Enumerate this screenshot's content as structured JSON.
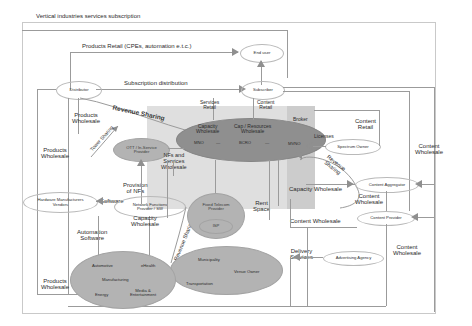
{
  "diagram": {
    "title": "Vertical industries services subscription",
    "type": "telecom ecosystem value-network diagram",
    "nodes": [
      {
        "id": "end-user",
        "label": "End user",
        "shape": "ellipse",
        "fill": "white"
      },
      {
        "id": "subscriber",
        "label": "Subscriber",
        "shape": "ellipse",
        "fill": "white"
      },
      {
        "id": "distributor",
        "label": "Distributor",
        "shape": "ellipse",
        "fill": "white"
      },
      {
        "id": "operators",
        "label": "",
        "shape": "ellipse",
        "fill": "dark-grey"
      },
      {
        "id": "mno",
        "label": "MNO",
        "shape": "text-in-ellipse"
      },
      {
        "id": "bcro",
        "label": "BCRO",
        "shape": "text-in-ellipse"
      },
      {
        "id": "mvno",
        "label": "MVNO",
        "shape": "text-in-ellipse"
      },
      {
        "id": "ott-provider",
        "label": "OTT / In-Service\nProvider",
        "shape": "ellipse",
        "fill": "light-grey"
      },
      {
        "id": "spectrum-owner",
        "label": "Spectrum Owner",
        "shape": "ellipse",
        "fill": "white"
      },
      {
        "id": "content-aggregator",
        "label": "Content Aggregator",
        "shape": "ellipse",
        "fill": "white"
      },
      {
        "id": "content-provider",
        "label": "Content Provider",
        "shape": "ellipse",
        "fill": "white"
      },
      {
        "id": "advertising-agency",
        "label": "Advertising Agency",
        "shape": "ellipse",
        "fill": "white"
      },
      {
        "id": "hardware-manufacturers",
        "label": "Hardware Manufacturers\nVendors",
        "shape": "ellipse",
        "fill": "white"
      },
      {
        "id": "nf-provider",
        "label": "Network Functions\nProvider / SW",
        "shape": "ellipse",
        "fill": "white"
      },
      {
        "id": "fixed-telecom-provider",
        "label": "Fixed Telecom\nProvider",
        "shape": "ellipse",
        "fill": "grey"
      },
      {
        "id": "isp",
        "label": "ISP",
        "shape": "ellipse",
        "fill": "grey"
      },
      {
        "id": "municipality-group",
        "label": "",
        "shape": "ellipse",
        "fill": "grey"
      },
      {
        "id": "municipality",
        "label": "Municipality",
        "shape": "text"
      },
      {
        "id": "venue-owner",
        "label": "Venue Owner",
        "shape": "text"
      },
      {
        "id": "transportation",
        "label": "Transportation",
        "shape": "text"
      },
      {
        "id": "verticals-group",
        "label": "",
        "shape": "ellipse",
        "fill": "grey"
      },
      {
        "id": "automotive",
        "label": "Automotive",
        "shape": "text"
      },
      {
        "id": "ehealth",
        "label": "eHealth",
        "shape": "text"
      },
      {
        "id": "manufacturing",
        "label": "Manufacturing",
        "shape": "text"
      },
      {
        "id": "energy",
        "label": "Energy",
        "shape": "text"
      },
      {
        "id": "media-entertainment",
        "label": "Media &\nEntertainment",
        "shape": "text"
      }
    ],
    "edge_labels": [
      {
        "id": "products-retail",
        "text": "Products Retail (CPEs, automation e.t.c.)"
      },
      {
        "id": "subscription-distribution",
        "text": "Subscription distribution"
      },
      {
        "id": "revenue-sharing-top",
        "text": "Revenue Sharing"
      },
      {
        "id": "services-retail",
        "text": "Services\nRetail"
      },
      {
        "id": "content-retail-top",
        "text": "Content\nRetail"
      },
      {
        "id": "capacity-wholesale-1",
        "text": "Capacity\nWholesale"
      },
      {
        "id": "cap-resources-wholesale",
        "text": "Cap / Resources\nWholesale"
      },
      {
        "id": "broker",
        "text": "Broker"
      },
      {
        "id": "licenses",
        "text": "Licenses"
      },
      {
        "id": "content-retail-right",
        "text": "Content\nRetail"
      },
      {
        "id": "content-wholesale-far-right",
        "text": "Content\nWholesale"
      },
      {
        "id": "revenue-sharing-right",
        "text": "Revenue\nSharing"
      },
      {
        "id": "capacity-wholesale-right",
        "text": "Capacity Wholesale"
      },
      {
        "id": "content-wholesale-mid",
        "text": "Content\nWholesale"
      },
      {
        "id": "content-wholesale-left2",
        "text": "Content Wholesale"
      },
      {
        "id": "content-wholesale-right2",
        "text": "Content\nWholesale"
      },
      {
        "id": "delivery-services",
        "text": "Delivery\nServices"
      },
      {
        "id": "products-wholesale-1",
        "text": "Products\nWholesale"
      },
      {
        "id": "products-wholesale-2",
        "text": "Products\nWholesale"
      },
      {
        "id": "products-wholesale-3",
        "text": "Products\nWholesale"
      },
      {
        "id": "tower-sharing",
        "text": "Tower Sharing"
      },
      {
        "id": "nfs-services-wholesale",
        "text": "NFs and\nServices\nWholesale"
      },
      {
        "id": "provision-of-nfs",
        "text": "Provision\nof NFs"
      },
      {
        "id": "software",
        "text": "Software"
      },
      {
        "id": "automation-software",
        "text": "Automation\nSoftware"
      },
      {
        "id": "capacity-wholesale-2",
        "text": "Capacity\nWholesale"
      },
      {
        "id": "revenue-sharing-vert",
        "text": "Revenue Sharing"
      },
      {
        "id": "rent-space",
        "text": "Rent\nSpace"
      }
    ]
  }
}
